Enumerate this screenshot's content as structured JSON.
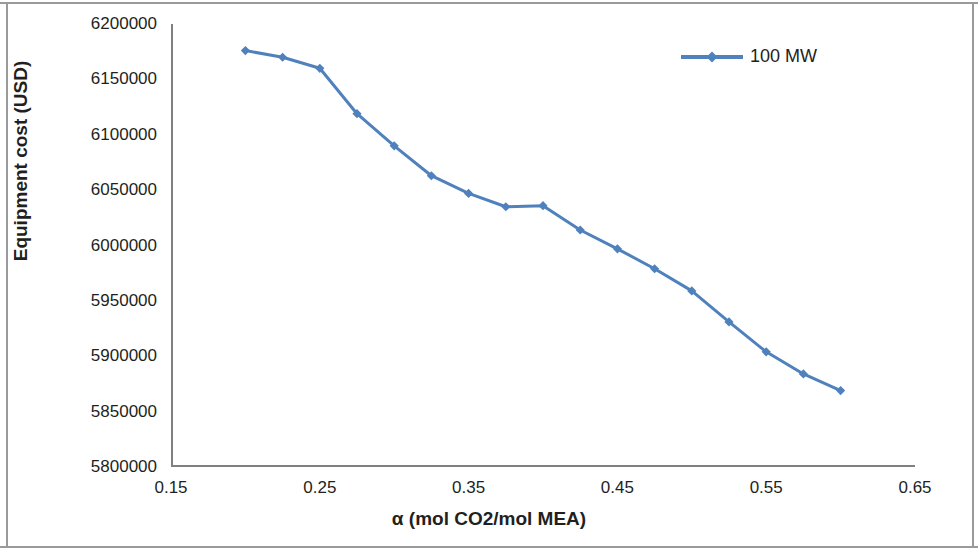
{
  "figure": {
    "background": "#ffffff",
    "frame_color": "#9a9a9a",
    "axis_color": "#808080"
  },
  "axes": {
    "y_title": "Equipment cost (USD)",
    "x_title": "α (mol CO2/mol MEA)",
    "y_ticks": [
      "5800000",
      "5850000",
      "5900000",
      "5950000",
      "6000000",
      "6050000",
      "6100000",
      "6150000",
      "6200000"
    ],
    "x_ticks": [
      "0.15",
      "0.25",
      "0.35",
      "0.45",
      "0.55",
      "0.65"
    ]
  },
  "legend": {
    "position": "top-right",
    "entries": [
      {
        "label": "100 MW",
        "color": "#4f81bd",
        "marker": "diamond"
      }
    ]
  },
  "chart_data": {
    "type": "line",
    "title": "",
    "subtitle": "",
    "xlabel": "α (mol CO2/mol MEA)",
    "ylabel": "Equipment cost (USD)",
    "xlim": [
      0.15,
      0.65
    ],
    "ylim": [
      5800000,
      6200000
    ],
    "xticks": [
      0.15,
      0.25,
      0.35,
      0.45,
      0.55,
      0.65
    ],
    "yticks": [
      5800000,
      5850000,
      5900000,
      5950000,
      6000000,
      6050000,
      6100000,
      6150000,
      6200000
    ],
    "grid": false,
    "legend_position": "top-right",
    "x": [
      0.2,
      0.225,
      0.25,
      0.275,
      0.3,
      0.325,
      0.35,
      0.375,
      0.4,
      0.425,
      0.45,
      0.475,
      0.5,
      0.525,
      0.55,
      0.575,
      0.6
    ],
    "series": [
      {
        "name": "100 MW",
        "color": "#4f81bd",
        "marker": "diamond",
        "line_width": 3,
        "values": [
          6176000,
          6170000,
          6160000,
          6119000,
          6090000,
          6063000,
          6047000,
          6035000,
          6036000,
          6014000,
          5997000,
          5979000,
          5959000,
          5931000,
          5904000,
          5884000,
          5869000
        ]
      }
    ]
  }
}
